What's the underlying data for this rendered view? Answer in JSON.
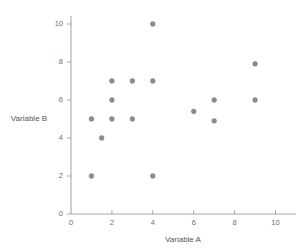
{
  "chart_data": {
    "type": "scatter",
    "title": "",
    "xlabel": "Variable A",
    "ylabel": "Variable B",
    "xlim": [
      0,
      11
    ],
    "ylim": [
      0,
      11
    ],
    "xticks": [
      0,
      2,
      4,
      6,
      8,
      10
    ],
    "yticks": [
      0,
      2,
      4,
      6,
      8,
      10
    ],
    "xtick_labels": [
      "0",
      "2",
      "4",
      "6",
      "8",
      "10"
    ],
    "ytick_labels": [
      "0",
      "2",
      "4",
      "6",
      "8",
      "10"
    ],
    "grid": false,
    "legend": false,
    "legend_position": "none",
    "marker_color": "#8c8c8c",
    "axis_color": "#a8a8a8",
    "points": [
      {
        "x": 1,
        "y": 5
      },
      {
        "x": 1,
        "y": 2
      },
      {
        "x": 1.5,
        "y": 4
      },
      {
        "x": 2,
        "y": 7
      },
      {
        "x": 2,
        "y": 6
      },
      {
        "x": 2,
        "y": 5
      },
      {
        "x": 3,
        "y": 7
      },
      {
        "x": 3,
        "y": 5
      },
      {
        "x": 4,
        "y": 10
      },
      {
        "x": 4,
        "y": 7
      },
      {
        "x": 4,
        "y": 2
      },
      {
        "x": 6,
        "y": 5.4
      },
      {
        "x": 7,
        "y": 6
      },
      {
        "x": 7,
        "y": 4.9
      },
      {
        "x": 9,
        "y": 7.9
      },
      {
        "x": 9,
        "y": 6
      }
    ],
    "x": [
      1,
      1,
      1.5,
      2,
      2,
      2,
      3,
      3,
      4,
      4,
      4,
      6,
      7,
      7,
      9,
      9
    ],
    "y": [
      5,
      2,
      4,
      7,
      6,
      5,
      7,
      5,
      10,
      7,
      2,
      5.4,
      6,
      4.9,
      7.9,
      6
    ]
  }
}
